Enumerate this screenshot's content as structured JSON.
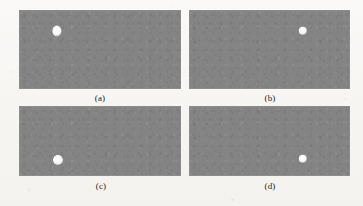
{
  "figure": {
    "background_color": "#f8f7f5",
    "width": 363,
    "height": 206,
    "panel_fill_color": "#848484",
    "marker_color": "#ffffff",
    "panels": [
      {
        "id": "panel-a",
        "label": "(a)",
        "x": 19,
        "y": 10,
        "width": 162,
        "height": 79,
        "label_x": 100,
        "label_y": 93,
        "marker": {
          "cx": 57,
          "cy": 31,
          "rx": 4.6,
          "ry": 5.4
        }
      },
      {
        "id": "panel-b",
        "label": "(b)",
        "x": 189,
        "y": 10,
        "width": 161,
        "height": 79,
        "label_x": 270,
        "label_y": 93,
        "marker": {
          "cx": 303,
          "cy": 31,
          "rx": 4.2,
          "ry": 4.2
        }
      },
      {
        "id": "panel-c",
        "label": "(c)",
        "x": 19,
        "y": 106,
        "width": 162,
        "height": 70,
        "label_x": 101,
        "label_y": 181,
        "marker": {
          "cx": 58,
          "cy": 160,
          "rx": 5.0,
          "ry": 5.0
        }
      },
      {
        "id": "panel-d",
        "label": "(d)",
        "x": 189,
        "y": 106,
        "width": 161,
        "height": 70,
        "label_x": 270,
        "label_y": 181,
        "marker": {
          "cx": 303,
          "cy": 159,
          "rx": 4.2,
          "ry": 4.2
        }
      }
    ]
  }
}
